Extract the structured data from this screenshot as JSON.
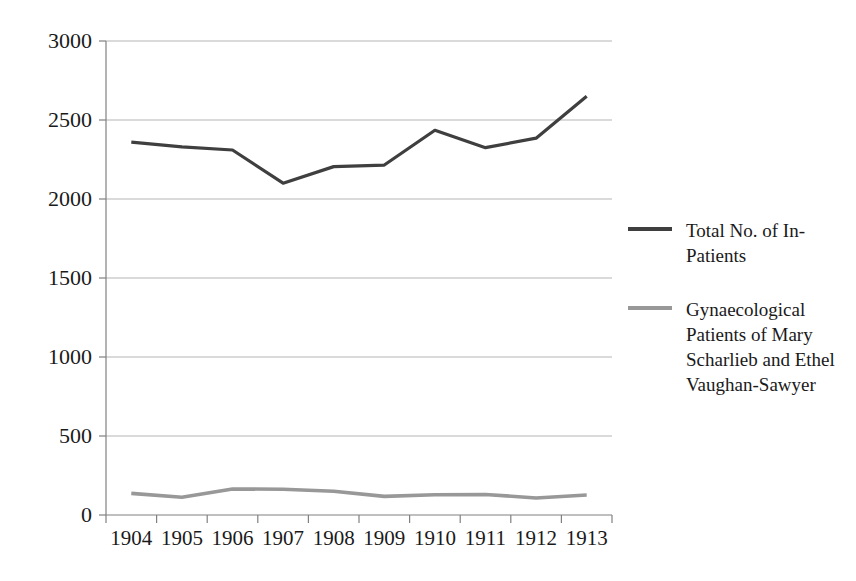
{
  "chart_data": {
    "type": "line",
    "title": "",
    "subtitle": "",
    "xlabel": "",
    "ylabel": "",
    "categories": [
      "1904",
      "1905",
      "1906",
      "1907",
      "1908",
      "1909",
      "1910",
      "1911",
      "1912",
      "1913"
    ],
    "ylim": [
      0,
      3000
    ],
    "ytick_values": [
      0,
      500,
      1000,
      1500,
      2000,
      2500,
      3000
    ],
    "ytick_labels": [
      "0",
      "500",
      "1000",
      "1500",
      "2000",
      "2500",
      "3000"
    ],
    "grid": true,
    "grid_axis": "y",
    "legend_position": "right",
    "series": [
      {
        "name": "Total No. of In-Patients",
        "color": "#3f3f3f",
        "values": [
          2360,
          2330,
          2310,
          2100,
          2205,
          2215,
          2435,
          2325,
          2385,
          2650
        ]
      },
      {
        "name": "Gynaecological Patients of Mary Scharlieb and Ethel Vaughan-Sawyer",
        "color": "#989898",
        "values": [
          137,
          112,
          165,
          163,
          150,
          118,
          128,
          130,
          108,
          127
        ]
      }
    ]
  },
  "legend": {
    "items": [
      {
        "label": "Total No. of In-Patients",
        "color": "#3f3f3f"
      },
      {
        "label": "Gynaecological Patients of Mary Scharlieb and Ethel Vaughan-Sawyer",
        "color": "#989898"
      }
    ]
  },
  "axes": {
    "y_tick_labels": [
      "3000",
      "2500",
      "2000",
      "1500",
      "1000",
      "500",
      "0"
    ],
    "x_tick_labels": [
      "1904",
      "1905",
      "1906",
      "1907",
      "1908",
      "1909",
      "1910",
      "1911",
      "1912",
      "1913"
    ]
  },
  "colors": {
    "series_dark": "#3f3f3f",
    "series_gray": "#989898",
    "gridline": "#b5b5b5",
    "axis": "#808080",
    "text": "#1a1a1a",
    "background": "#ffffff"
  }
}
